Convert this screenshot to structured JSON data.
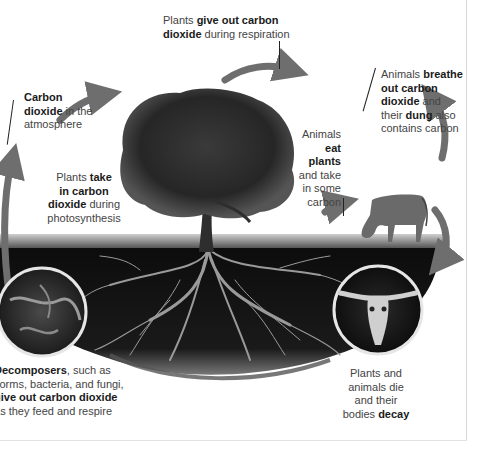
{
  "diagram": {
    "colors": {
      "arrow": "#6e6e6e",
      "soil": "#111111",
      "sky": "#ffffff",
      "text": "#444444",
      "text_bold": "#1a1a1a"
    },
    "labels": {
      "respiration": {
        "pre": "Plants ",
        "bold1": "give out carbon",
        "bold2": "dioxide",
        "post": " during respiration"
      },
      "atmosphere": {
        "bold1": "Carbon",
        "bold2": "dioxide",
        "post1": " in the",
        "post2": "atmosphere"
      },
      "photosynthesis": {
        "pre": "Plants ",
        "bold1": "take",
        "bold2": "in carbon",
        "bold3": "dioxide",
        "post1": " during",
        "post2": "photosynthesis"
      },
      "animals_eat": {
        "l1": "Animals",
        "bold1": "eat",
        "bold2": "plants",
        "l4": "and take",
        "l5": "in some",
        "l6": "carbon"
      },
      "animals_breathe": {
        "pre": "Animals ",
        "bold1": "breathe",
        "bold2": "out carbon",
        "bold3": "dioxide",
        "post3": " and",
        "pre4": "their ",
        "bold4": "dung",
        "post4": " also",
        "l5": "contains carbon"
      },
      "decomposers": {
        "bold1": "ecomposers",
        "post1": ", such as",
        "l2": "vorms, bacteria, and fungi,",
        "bold3": "ive out carbon dioxide",
        "l4": "s they feed and respire",
        "l1_first": "D",
        "l3_first": "g",
        "l4_first": "a"
      },
      "decay": {
        "l1": "Plants and",
        "l2": "animals die",
        "l3": "and their",
        "pre4": "bodies ",
        "bold4": "decay"
      }
    },
    "icons": [
      "tree-image",
      "cow-image",
      "soil-decomposers-inset",
      "skull-inset",
      "cycle-arrows"
    ]
  }
}
